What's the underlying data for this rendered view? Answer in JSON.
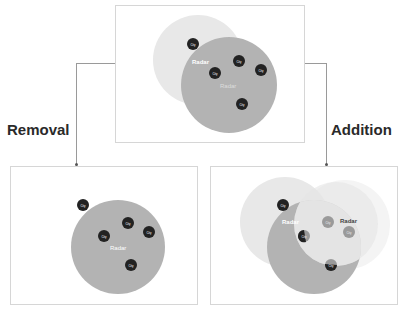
{
  "labels": {
    "removal": "Removal",
    "addition": "Addition"
  },
  "node_text": {
    "city": "City",
    "radar": "Radar",
    "radar_secondary": "Radar"
  },
  "colors": {
    "radar_dark": "#b3b3b3",
    "radar_light": "#e8e8e8",
    "radar_faint": "#f2f2f2",
    "city_fill": "#222222",
    "city_muted": "#9a9a9a",
    "frame_border": "#d6d6d6",
    "connector": "#9a9a9a",
    "label_text": "#2a2a2a"
  },
  "panels": {
    "top": {
      "name": "original-state"
    },
    "left": {
      "name": "after-removal"
    },
    "right": {
      "name": "after-addition"
    }
  }
}
